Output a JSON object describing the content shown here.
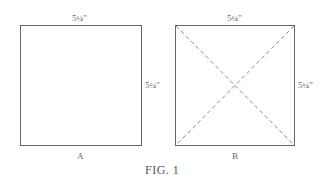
{
  "figure": {
    "caption": "FIG. 1",
    "square_a": {
      "label": "A",
      "top_dimension": "5¼\"",
      "side_dimension": "5¼\""
    },
    "square_b": {
      "label": "B",
      "top_dimension": "5¼\"",
      "side_dimension": "5¼\"",
      "diagonals": "dashed"
    },
    "colors": {
      "line": "#666666",
      "dash": "#888888"
    }
  }
}
